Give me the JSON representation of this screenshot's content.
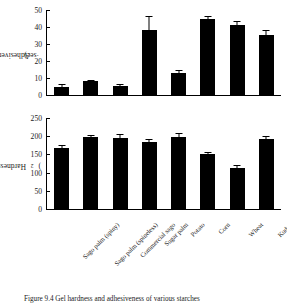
{
  "figure": {
    "caption": "Figure 9.4 Gel hardness and adhesiveness of various starches"
  },
  "chart_data": [
    {
      "type": "bar",
      "id": "adhesiveness",
      "title": "",
      "xlabel": "",
      "ylabel": "Adhesiveness (gw·sec)",
      "ylabel_main": "Adhesiveness (gw",
      "ylabel_unit_mid": "·sec)",
      "ylim": [
        0,
        50
      ],
      "yticks": [
        0,
        10,
        20,
        30,
        40,
        50
      ],
      "ytick_labels": [
        "0",
        "10",
        "20",
        "30",
        "40",
        "50"
      ],
      "grid": false,
      "legend": "none",
      "categories": [
        "Sago palm (spiny)",
        "Sago palm (spineless)",
        "Commercial sago",
        "Sugar palm",
        "Potato",
        "Corn",
        "Wheat",
        "Kudzu"
      ],
      "values": [
        5.0,
        8.0,
        5.4,
        38.2,
        13.0,
        44.6,
        41.2,
        35.5
      ],
      "errors": [
        0.6,
        0.5,
        0.5,
        7.6,
        1.3,
        1.2,
        1.6,
        2.2
      ]
    },
    {
      "type": "bar",
      "id": "hardness",
      "title": "",
      "xlabel": "",
      "ylabel": "Hardness (gw/cm2)",
      "ylabel_main": "Hardness (gw/cm",
      "ylabel_sup": "2",
      "ylabel_tail": ")",
      "ylim": [
        0,
        250
      ],
      "yticks": [
        0,
        50,
        100,
        150,
        200,
        250
      ],
      "ytick_labels": [
        "0",
        "50",
        "100",
        "150",
        "200",
        "250"
      ],
      "grid": false,
      "legend": "none",
      "categories": [
        "Sago palm (spiny)",
        "Sago palm (spineless)",
        "Commercial sago",
        "Sugar palm",
        "Potato",
        "Corn",
        "Wheat",
        "Kudzu"
      ],
      "values": [
        168,
        197,
        196,
        185,
        198,
        151,
        114,
        192
      ],
      "errors": [
        6,
        3,
        7,
        6,
        8,
        4,
        4,
        6
      ]
    }
  ]
}
